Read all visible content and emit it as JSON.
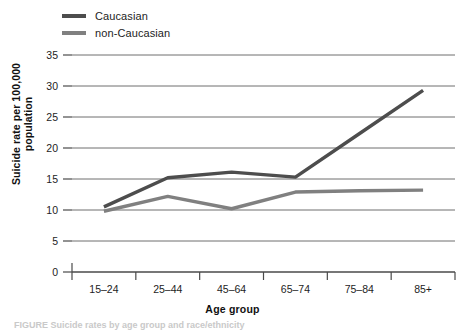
{
  "legend": {
    "position": "top-left",
    "items": [
      {
        "label": "Caucasian",
        "color": "#4d4d4d"
      },
      {
        "label": "non-Caucasian",
        "color": "#808080"
      }
    ]
  },
  "axes": {
    "xlabel": "Age group",
    "ylabel": "Suicide rate per 100,000 population",
    "yticks": [
      "0",
      "5",
      "10",
      "15",
      "20",
      "25",
      "30",
      "35"
    ],
    "xticklabels": [
      "15–24",
      "25–44",
      "45–64",
      "65–74",
      "75–84",
      "85+"
    ]
  },
  "caption": "FIGURE  Suicide rates by age group and race/ethnicity",
  "chart_data": {
    "type": "line",
    "title": "",
    "xlabel": "Age group",
    "ylabel": "Suicide rate per 100,000 population",
    "categories": [
      "15–24",
      "25–44",
      "45–64",
      "65–74",
      "75–84",
      "85+"
    ],
    "series": [
      {
        "name": "Caucasian",
        "color": "#4d4d4d",
        "values": [
          10.5,
          15.2,
          16.1,
          15.3,
          22.3,
          29.3
        ]
      },
      {
        "name": "non-Caucasian",
        "color": "#808080",
        "values": [
          9.8,
          12.2,
          10.2,
          12.9,
          13.1,
          13.2
        ]
      }
    ],
    "ylim": [
      0,
      35
    ],
    "ytick_step": 5,
    "grid": true,
    "grid_axis": "y",
    "legend_position": "top-left"
  }
}
